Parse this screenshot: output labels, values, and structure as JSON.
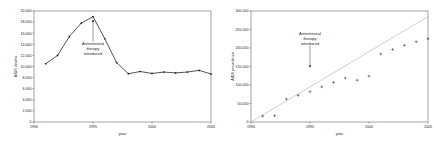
{
  "figure": {
    "background": "#ffffff",
    "ink": "#1a1a1a",
    "trendline_color": "#b9b9b9"
  },
  "chart_data": [
    {
      "type": "line",
      "title": "",
      "xlabel": "year",
      "ylabel": "AIDS deaths",
      "xlim": [
        1990,
        2005
      ],
      "ylim": [
        0,
        20000
      ],
      "xticks": [
        1990,
        1995,
        2000,
        2005
      ],
      "xtick_labels": [
        "1990",
        "1995",
        "2000",
        "2005"
      ],
      "yticks": [
        0,
        2000,
        4000,
        6000,
        8000,
        10000,
        12000,
        14000,
        16000,
        18000,
        20000
      ],
      "ytick_labels": [
        "0",
        "2,000",
        "4,000",
        "6,000",
        "8,000",
        "10,000",
        "12,000",
        "14,000",
        "16,000",
        "18,000",
        "20,000"
      ],
      "grid": false,
      "legend": "none",
      "marker": "filled-circle",
      "x": [
        1991,
        1992,
        1993,
        1994,
        1995,
        1996,
        1997,
        1998,
        1999,
        2000,
        2001,
        2002,
        2003,
        2004,
        2005
      ],
      "values": [
        10500,
        12000,
        15400,
        17800,
        19000,
        15000,
        10700,
        8700,
        9100,
        8750,
        9000,
        8850,
        9000,
        9300,
        8650
      ],
      "annotations": [
        {
          "text_lines": [
            "Antiretroviral",
            "therapy",
            "introduced"
          ],
          "points_to_year": 1995,
          "points_to_value": 19000,
          "arrow_direction": "up"
        }
      ]
    },
    {
      "type": "scatter",
      "title": "",
      "xlabel": "year",
      "ylabel": "AIDS prevalence",
      "xlim": [
        1990,
        2005
      ],
      "ylim": [
        0,
        300000
      ],
      "xticks": [
        1990,
        1995,
        2000,
        2005
      ],
      "xtick_labels": [
        "1990",
        "1995",
        "2000",
        "2005"
      ],
      "yticks": [
        0,
        50000,
        100000,
        150000,
        200000,
        250000,
        300000
      ],
      "ytick_labels": [
        "0",
        "50,000",
        "100,000",
        "150,000",
        "200,000",
        "250,000",
        "300,000"
      ],
      "grid": false,
      "legend": "none",
      "marker": "plus",
      "x": [
        1991,
        1992,
        1993,
        1994,
        1995,
        1996,
        1997,
        1998,
        1999,
        2000,
        2001,
        2002,
        2003,
        2004,
        2005
      ],
      "values": [
        16000,
        17000,
        62000,
        72000,
        82000,
        95000,
        107000,
        119000,
        113000,
        124000,
        184000,
        196000,
        207000,
        217000,
        225000
      ],
      "trendline": {
        "x": [
          1990,
          2005
        ],
        "y": [
          0,
          285000
        ]
      },
      "annotations": [
        {
          "text_lines": [
            "Antiretroviral",
            "therapy",
            "introduced"
          ],
          "points_to_year": 1995,
          "points_to_value": 139000,
          "arrow_direction": "down"
        }
      ]
    }
  ]
}
